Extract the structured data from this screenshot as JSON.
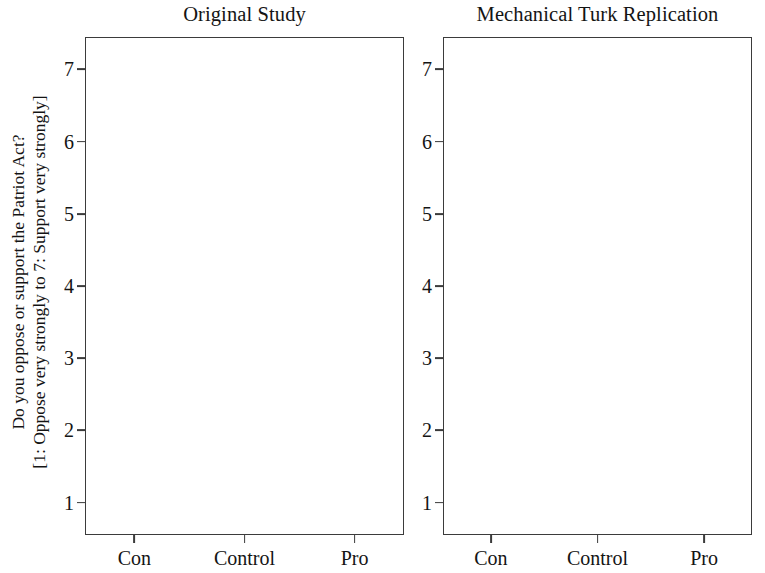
{
  "figure": {
    "ylabel_line1": "Do you oppose or support the Patriot Act?",
    "ylabel_line2": "[1: Oppose very strongly to 7: Support very strongly]"
  },
  "chart_data": [
    {
      "type": "line",
      "title": "Original Study",
      "xlabel": "",
      "ylabel": "Do you oppose or support the Patriot Act? [1: Oppose very strongly to 7: Support very strongly]",
      "categories": [
        "Con",
        "Control",
        "Pro"
      ],
      "yticks": [
        1,
        2,
        3,
        4,
        5,
        6,
        7
      ],
      "ylim": [
        0.55,
        7.45
      ],
      "grid": true,
      "legend_position": "inline-annotation",
      "series": [
        {
          "name": "Republicans",
          "marker": "triangle",
          "values": [
            4.25,
            5.07,
            5.63
          ],
          "err_low": [
            3.95,
            4.47,
            5.4
          ],
          "err_high": [
            4.6,
            5.62,
            5.9
          ],
          "annotation": "Republicans"
        },
        {
          "name": "Democrats",
          "marker": "circle",
          "values": [
            3.47,
            4.08,
            4.75
          ],
          "err_low": [
            3.25,
            3.6,
            4.53
          ],
          "err_high": [
            3.68,
            4.55,
            4.95
          ],
          "annotation": "Democrats"
        }
      ]
    },
    {
      "type": "line",
      "title": "Mechanical Turk Replication",
      "xlabel": "",
      "ylabel": "",
      "categories": [
        "Con",
        "Control",
        "Pro"
      ],
      "yticks": [
        1,
        2,
        3,
        4,
        5,
        6,
        7
      ],
      "ylim": [
        0.55,
        7.45
      ],
      "grid": true,
      "legend_position": "none",
      "series": [
        {
          "name": "Republicans",
          "marker": "triangle",
          "values": [
            3.72,
            4.37,
            4.92
          ],
          "err_low": [
            3.48,
            3.78,
            4.7
          ],
          "err_high": [
            3.97,
            5.0,
            5.12
          ],
          "annotation": ""
        },
        {
          "name": "Democrats",
          "marker": "circle",
          "values": [
            2.95,
            3.37,
            3.9
          ],
          "err_low": [
            2.84,
            3.0,
            3.78
          ],
          "err_high": [
            3.07,
            3.7,
            4.02
          ],
          "annotation": ""
        }
      ]
    }
  ],
  "colors": {
    "series_marker": "#111111",
    "frame": "#3b3b3b",
    "grid": "#d8d8d8",
    "cloud": "#b9b9b9"
  }
}
